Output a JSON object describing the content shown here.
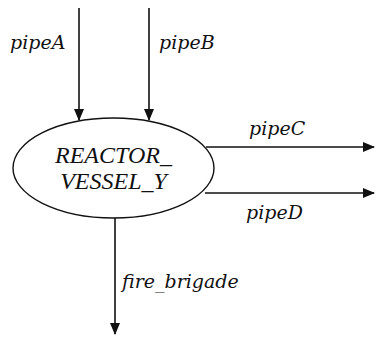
{
  "diagram": {
    "type": "flow",
    "colors": {
      "stroke": "#111111",
      "background": "#ffffff"
    },
    "node": {
      "id": "reactor_vessel_y",
      "shape": "ellipse",
      "line1": "REACTOR_",
      "line2": "VESSEL_Y"
    },
    "edges": [
      {
        "id": "pipeA",
        "label": "pipeA",
        "direction": "in",
        "from": "top"
      },
      {
        "id": "pipeB",
        "label": "pipeB",
        "direction": "in",
        "from": "top"
      },
      {
        "id": "pipeC",
        "label": "pipeC",
        "direction": "out",
        "to": "right"
      },
      {
        "id": "pipeD",
        "label": "pipeD",
        "direction": "out",
        "to": "right"
      },
      {
        "id": "fire_brigade",
        "label": "fire_brigade",
        "direction": "out",
        "to": "bottom"
      }
    ]
  }
}
